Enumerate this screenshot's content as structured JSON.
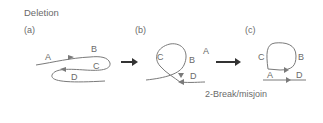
{
  "title": "Deletion",
  "panels": [
    {
      "label": "(a)",
      "segments": [
        "A",
        "B",
        "C",
        "D"
      ]
    },
    {
      "label": "(b)",
      "segments": [
        "C",
        "B",
        "A",
        "D"
      ]
    },
    {
      "label": "(c)",
      "segments": [
        "C",
        "B",
        "A",
        "D"
      ]
    }
  ],
  "caption": "2-Break/misjoin",
  "colors": {
    "line": "#7a7a7a",
    "arrow": "#444444",
    "text": "#6a6a6a"
  }
}
